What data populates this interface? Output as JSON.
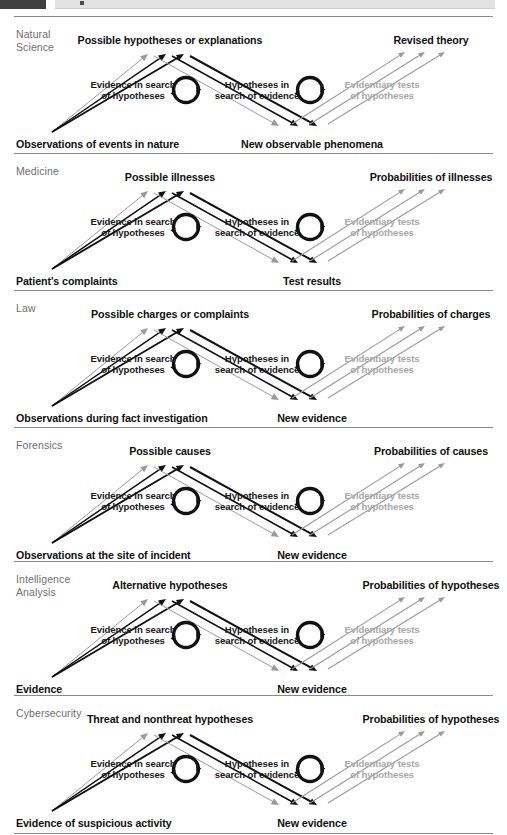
{
  "topbar": {
    "present": true
  },
  "figure": {
    "process_labels": {
      "left": "Evidence in search\nof hypotheses",
      "middle": "Hypotheses in\nsearch of evidence",
      "right": "Evidentiary tests\nof hypotheses"
    },
    "colors": {
      "black": "#111111",
      "gray_arrow": "#9a9a9a",
      "gray_text": "#a8a8a8",
      "discipline_text": "#6f6f6f",
      "divider": "#8a8a8a"
    },
    "rows": [
      {
        "discipline": "Natural\nScience",
        "bottom_left": "Observations of events in nature",
        "top_left": "Possible hypotheses or explanations",
        "bottom_right": "New observable phenomena",
        "top_right": "Revised theory"
      },
      {
        "discipline": "Medicine",
        "bottom_left": "Patient's complaints",
        "top_left": "Possible illnesses",
        "bottom_right": "Test results",
        "top_right": "Probabilities of illnesses"
      },
      {
        "discipline": "Law",
        "bottom_left": "Observations during fact investigation",
        "top_left": "Possible charges or complaints",
        "bottom_right": "New evidence",
        "top_right": "Probabilities of charges"
      },
      {
        "discipline": "Forensics",
        "bottom_left": "Observations at the site of incident",
        "top_left": "Possible causes",
        "bottom_right": "New evidence",
        "top_right": "Probabilities of causes"
      },
      {
        "discipline": "Intelligence\nAnalysis",
        "bottom_left": "Evidence",
        "top_left": "Alternative hypotheses",
        "bottom_right": "New evidence",
        "top_right": "Probabilities of hypotheses"
      },
      {
        "discipline": "Cybersecurity",
        "bottom_left": "Evidence of suspicious activity",
        "top_left": "Threat and nonthreat hypotheses",
        "bottom_right": "New evidence",
        "top_right": "Probabilities of hypotheses"
      }
    ]
  }
}
